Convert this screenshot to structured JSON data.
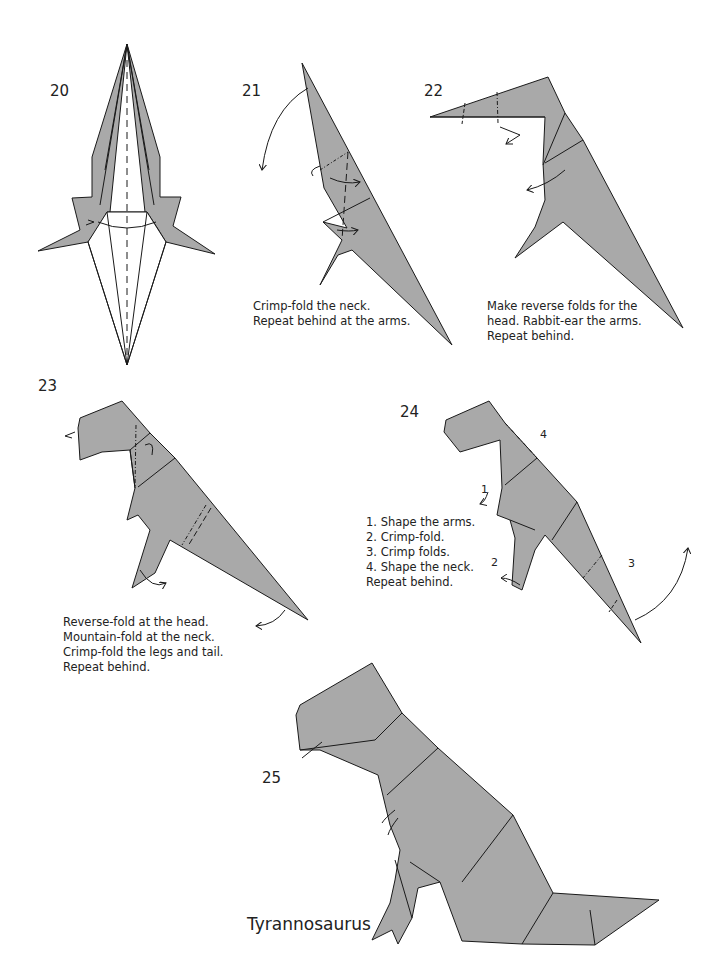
{
  "page": {
    "colors": {
      "paper": "#a9a9a9",
      "paper_light": "#bdbdbd",
      "line": "#1a1a1a",
      "background": "#ffffff"
    }
  },
  "steps": [
    {
      "number": "20",
      "caption": []
    },
    {
      "number": "21",
      "caption": [
        "Crimp-fold the neck.",
        "Repeat behind at the arms."
      ]
    },
    {
      "number": "22",
      "caption": [
        "Make reverse folds for the",
        "head. Rabbit-ear the arms.",
        "Repeat behind."
      ]
    },
    {
      "number": "23",
      "caption": [
        "Reverse-fold at the head.",
        "Mountain-fold at the neck.",
        "Crimp-fold the legs and tail.",
        "Repeat behind."
      ]
    },
    {
      "number": "24",
      "caption": [
        "1. Shape the arms.",
        "2. Crimp-fold.",
        "3. Crimp folds.",
        "4. Shape the neck.",
        "Repeat behind."
      ],
      "markers": [
        "1",
        "2",
        "3",
        "4"
      ]
    },
    {
      "number": "25",
      "caption": []
    }
  ],
  "final_model": {
    "name": "Tyrannosaurus"
  }
}
